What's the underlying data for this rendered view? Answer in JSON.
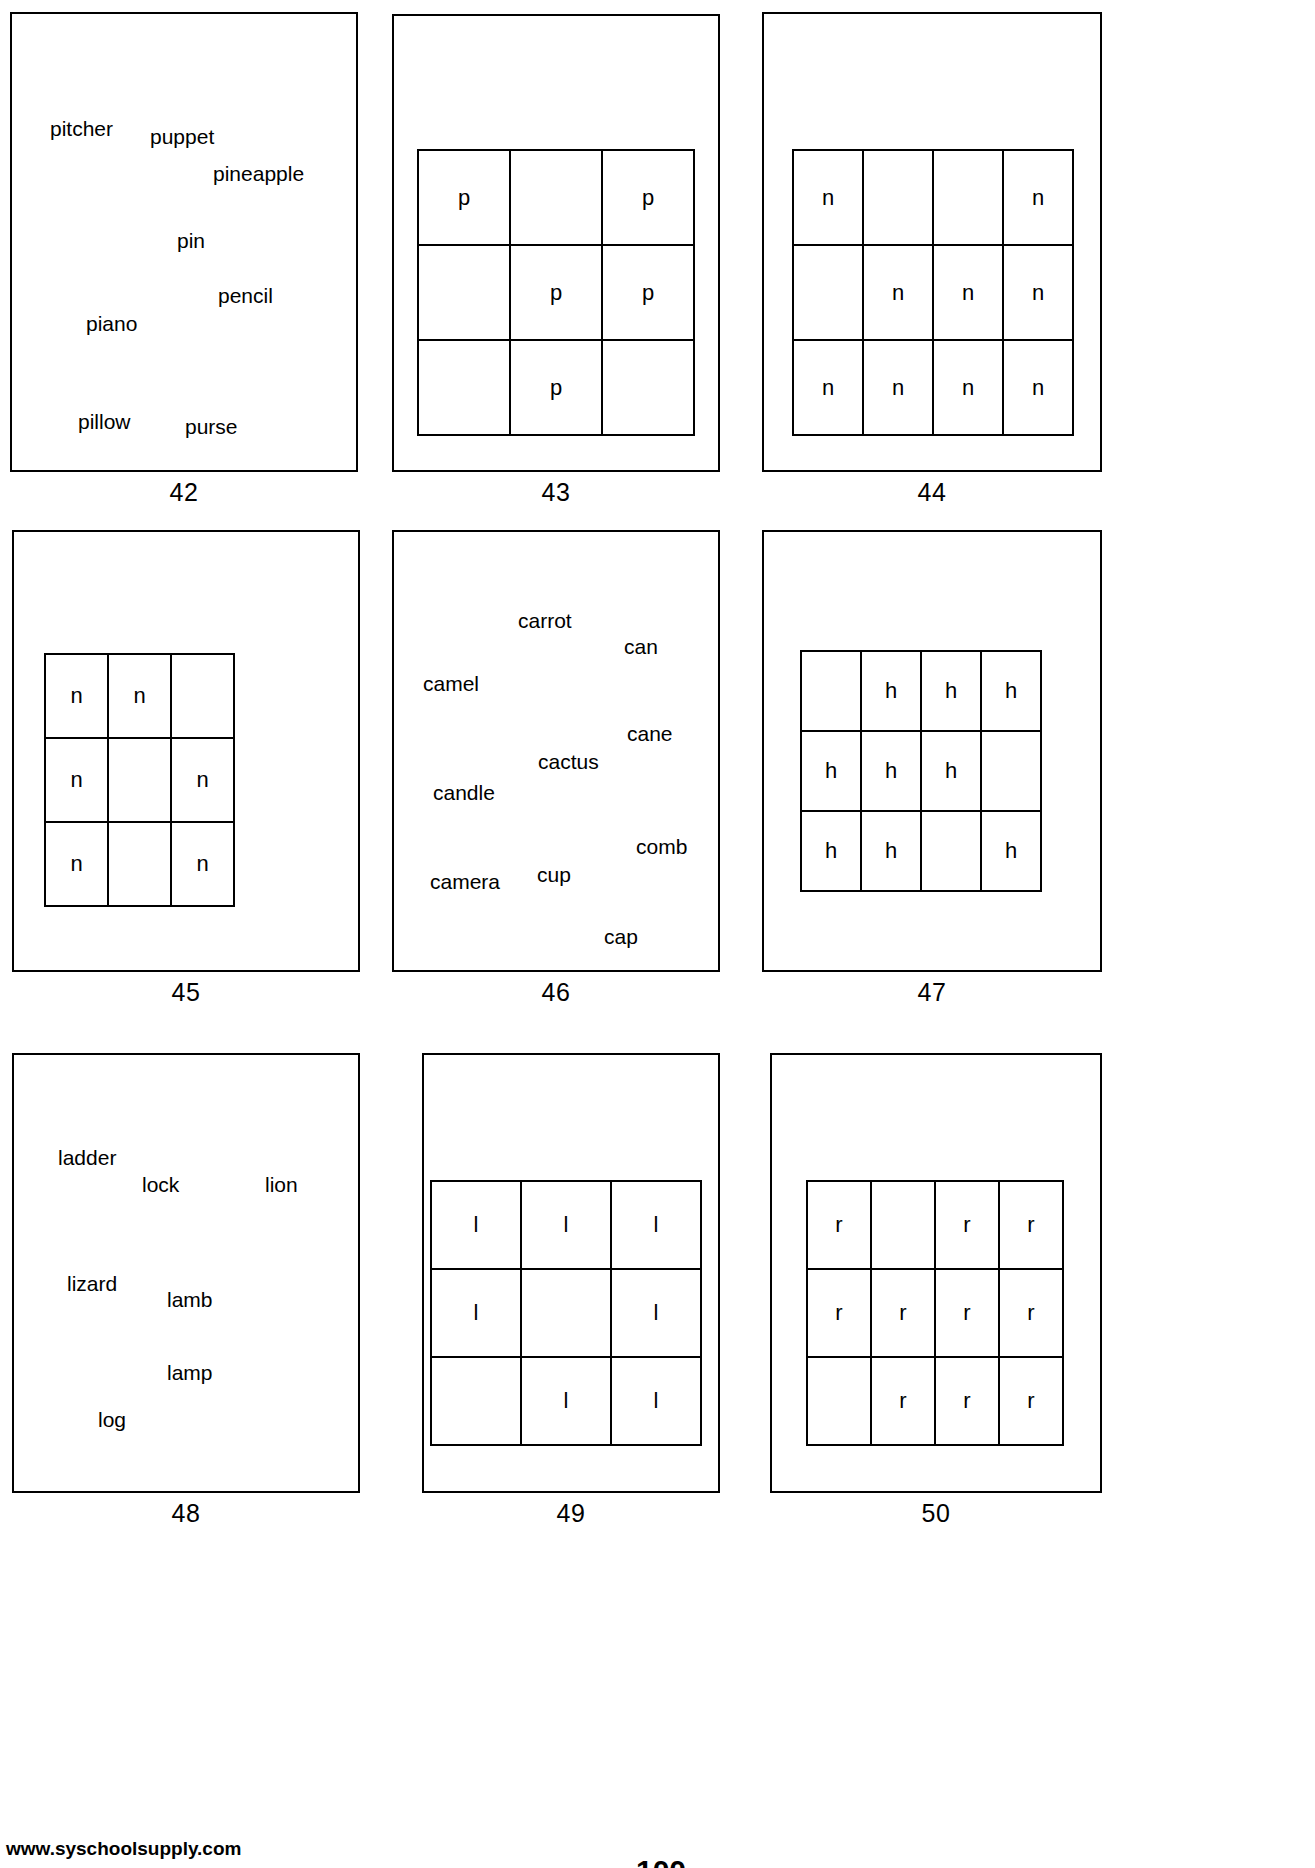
{
  "page": {
    "footer_left": "www.syschoolsupply.com",
    "footer_center": "100",
    "footer_right": ""
  },
  "cards": [
    {
      "number": "42",
      "type": "words",
      "words": [
        {
          "text": "pitcher",
          "x": 50,
          "y": 114
        },
        {
          "text": "puppet",
          "x": 148,
          "y": 120
        },
        {
          "text": "pineapple",
          "x": 212,
          "y": 157
        },
        {
          "text": "pin",
          "x": 175,
          "y": 224
        },
        {
          "text": "pencil",
          "x": 217,
          "y": 279
        },
        {
          "text": "piano",
          "x": 85,
          "y": 308
        },
        {
          "text": "pillow",
          "x": 78,
          "y": 407
        },
        {
          "text": "purse",
          "x": 184,
          "y": 412
        }
      ]
    },
    {
      "number": "43",
      "type": "grid",
      "rows": 3,
      "cols": 3,
      "cells": [
        "p",
        "",
        "p",
        "",
        "p",
        "p",
        "",
        "p",
        ""
      ]
    },
    {
      "number": "44",
      "type": "grid",
      "rows": 3,
      "cols": 4,
      "cells": [
        "n",
        "",
        "",
        "n",
        "",
        "n",
        "n",
        "n",
        "n",
        "n",
        "n",
        "n"
      ]
    },
    {
      "number": "45",
      "type": "grid",
      "rows": 3,
      "cols": 3,
      "cells": [
        "n",
        "n",
        "",
        "n",
        "",
        "n",
        "n",
        "",
        "n"
      ]
    },
    {
      "number": "46",
      "type": "words",
      "words": [
        {
          "text": "carrot",
          "x": 126,
          "y": 610
        },
        {
          "text": "can",
          "x": 234,
          "y": 635
        },
        {
          "text": "camel",
          "x": 32,
          "y": 673
        },
        {
          "text": "cane",
          "x": 236,
          "y": 723
        },
        {
          "text": "cactus",
          "x": 146,
          "y": 751
        },
        {
          "text": "candle",
          "x": 42,
          "y": 782
        },
        {
          "text": "comb",
          "x": 245,
          "y": 838
        },
        {
          "text": "camera",
          "x": 39,
          "y": 873
        },
        {
          "text": "cup",
          "x": 145,
          "y": 866
        },
        {
          "text": "cap",
          "x": 213,
          "y": 928
        }
      ]
    },
    {
      "number": "47",
      "type": "grid",
      "rows": 3,
      "cols": 4,
      "cells": [
        "",
        "h",
        "h",
        "h",
        "h",
        "h",
        "h",
        "",
        "h",
        "h",
        "",
        "h"
      ]
    },
    {
      "number": "48",
      "type": "words",
      "words": [
        {
          "text": "ladder",
          "x": 36,
          "y": 1148
        },
        {
          "text": "lock",
          "x": 122,
          "y": 1174
        },
        {
          "text": "lion",
          "x": 245,
          "y": 1174
        },
        {
          "text": "lizard",
          "x": 45,
          "y": 1274
        },
        {
          "text": "lamb",
          "x": 145,
          "y": 1290
        },
        {
          "text": "lamp",
          "x": 145,
          "y": 1363
        },
        {
          "text": "log",
          "x": 75,
          "y": 1410
        }
      ]
    },
    {
      "number": "49",
      "type": "grid",
      "rows": 3,
      "cols": 3,
      "cells": [
        "l",
        "l",
        "l",
        "l",
        "",
        "l",
        "",
        "l",
        "l"
      ]
    },
    {
      "number": "50",
      "type": "grid",
      "rows": 3,
      "cols": 4,
      "cells": [
        "r",
        "",
        "r",
        "r",
        "r",
        "r",
        "r",
        "r",
        "",
        "r",
        "r",
        "r"
      ]
    }
  ],
  "layout": {
    "cards": [
      {
        "left": 10,
        "top": 12,
        "width": 348,
        "height": 460,
        "num_top": 470
      },
      {
        "left": 392,
        "top": 14,
        "width": 328,
        "height": 458,
        "num_top": 470
      },
      {
        "left": 762,
        "top": 12,
        "width": 340,
        "height": 460,
        "num_top": 470
      },
      {
        "left": 12,
        "top": 530,
        "width": 348,
        "height": 442,
        "num_top": 972
      },
      {
        "left": 392,
        "top": 530,
        "width": 328,
        "height": 442,
        "num_top": 972
      },
      {
        "left": 762,
        "top": 530,
        "width": 340,
        "height": 442,
        "num_top": 972
      },
      {
        "left": 12,
        "top": 1053,
        "width": 348,
        "height": 440,
        "num_top": 1492
      },
      {
        "left": 422,
        "top": 1053,
        "width": 298,
        "height": 440,
        "num_top": 1492
      },
      {
        "left": 770,
        "top": 1053,
        "width": 332,
        "height": 440,
        "num_top": 1492
      }
    ],
    "grids": [
      null,
      {
        "left": 25,
        "top": 135,
        "cell_w": 92,
        "cell_h": 95
      },
      {
        "left": 30,
        "top": 135,
        "cell_w": 71,
        "cell_h": 95
      },
      {
        "left": 32,
        "top": 123,
        "cell_w": 63,
        "cell_h": 84
      },
      null,
      {
        "left": 38,
        "top": 120,
        "cell_w": 60,
        "cell_h": 80
      },
      null,
      {
        "left": 8,
        "top": 127,
        "cell_w": 90,
        "cell_h": 88
      },
      {
        "left": 36,
        "top": 127,
        "cell_w": 64,
        "cell_h": 88
      }
    ]
  }
}
